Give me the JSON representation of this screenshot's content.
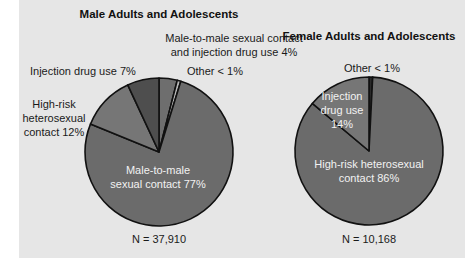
{
  "chart_data": [
    {
      "type": "pie",
      "title": "Male Adults and Adolescents",
      "n_label": "N = 37,910",
      "slices": [
        {
          "name": "Male-to-male sexual contact and injection drug use",
          "value": 4,
          "label_lines": [
            "Male-to-male sexual contact",
            "and injection drug use 4%"
          ],
          "color": "#6e6e6e"
        },
        {
          "name": "Other",
          "value": 0.8,
          "label_lines": [
            "Other < 1%"
          ],
          "color": "#b8b8b8"
        },
        {
          "name": "Male-to-male sexual contact",
          "value": 77,
          "label_lines": [
            "Male-to-male",
            "sexual contact 77%"
          ],
          "color": "#6b6b6b"
        },
        {
          "name": "High-risk heterosexual contact",
          "value": 12,
          "label_lines": [
            "High-risk",
            "heterosexual",
            "contact 12%"
          ],
          "color": "#767676"
        },
        {
          "name": "Injection drug use",
          "value": 7,
          "label_lines": [
            "Injection drug use 7%"
          ],
          "color": "#4e4e4e"
        }
      ]
    },
    {
      "type": "pie",
      "title": "Female Adults and Adolescents",
      "n_label": "N = 10,168",
      "slices": [
        {
          "name": "Other",
          "value": 0.8,
          "label_lines": [
            "Other < 1%"
          ],
          "color": "#2a2a2a"
        },
        {
          "name": "High-risk heterosexual contact",
          "value": 86,
          "label_lines": [
            "High-risk heterosexual",
            "contact 86%"
          ],
          "color": "#6b6b6b"
        },
        {
          "name": "Injection drug use",
          "value": 14,
          "label_lines": [
            "Injection",
            "drug use",
            "14%"
          ],
          "color": "#767676"
        }
      ]
    }
  ]
}
